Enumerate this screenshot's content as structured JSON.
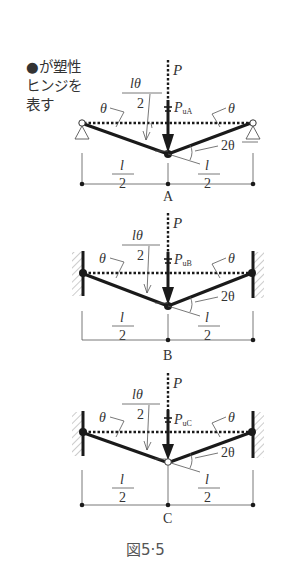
{
  "legend": {
    "line1": "●が塑性",
    "line2": "ヒンジを",
    "line3": "表す"
  },
  "caption": "図5·5",
  "colors": {
    "line": "#1a1a1a",
    "thin": "#444444",
    "hatch": "#999999",
    "text": "#333333"
  },
  "diagrams": [
    {
      "id": "A",
      "label": "A",
      "support": "pin",
      "load_label": "P",
      "collapse_label_main": "P",
      "collapse_label_sub": "uA",
      "theta_left": "θ",
      "theta_right": "θ",
      "two_theta": "2θ",
      "deflection_num": "lθ",
      "deflection_den": "2",
      "span_left_num": "l",
      "span_left_den": "2",
      "span_right_num": "l",
      "span_right_den": "2",
      "center_hinge": "filled"
    },
    {
      "id": "B",
      "label": "B",
      "support": "fixed",
      "load_label": "P",
      "collapse_label_main": "P",
      "collapse_label_sub": "uB",
      "theta_left": "θ",
      "theta_right": "θ",
      "two_theta": "2θ",
      "deflection_num": "lθ",
      "deflection_den": "2",
      "span_left_num": "l",
      "span_left_den": "2",
      "span_right_num": "l",
      "span_right_den": "2",
      "center_hinge": "filled"
    },
    {
      "id": "C",
      "label": "C",
      "support": "fixed",
      "load_label": "P",
      "collapse_label_main": "P",
      "collapse_label_sub": "uC",
      "theta_left": "θ",
      "theta_right": "θ",
      "two_theta": "2θ",
      "deflection_num": "lθ",
      "deflection_den": "2",
      "span_left_num": "l",
      "span_left_den": "2",
      "span_right_num": "l",
      "span_right_den": "2",
      "center_hinge": "open"
    }
  ]
}
